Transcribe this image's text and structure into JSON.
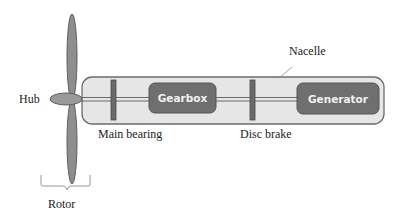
{
  "diagram": {
    "type": "wind-turbine-drivetrain-schematic",
    "labels": {
      "nacelle": "Nacelle",
      "hub": "Hub",
      "main_bearing": "Main bearing",
      "disc_brake": "Disc brake",
      "rotor": "Rotor"
    },
    "components": {
      "gearbox": "Gearbox",
      "generator": "Generator"
    },
    "colors": {
      "nacelle_fill": "#e6e6e6",
      "nacelle_stroke": "#6b6b6b",
      "component_fill": "#6f6f6f",
      "component_text": "#f2f2f2",
      "blade_fill": "#8e8e8e",
      "hub_fill": "#9a9a9a",
      "shaft": "#6b6b6b",
      "text": "#222222"
    }
  }
}
